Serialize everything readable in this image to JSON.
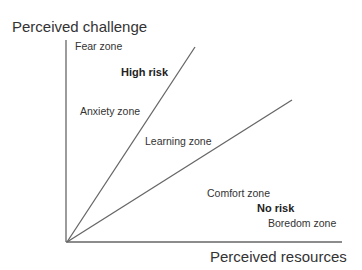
{
  "diagram": {
    "y_axis_label": "Perceived challenge",
    "x_axis_label": "Perceived resources",
    "zones": {
      "fear": "Fear zone",
      "anxiety": "Anxiety zone",
      "learning": "Learning zone",
      "comfort": "Comfort zone",
      "boredom": "Boredom zone"
    },
    "risk_labels": {
      "high": "High risk",
      "low": "No risk"
    },
    "line_color": "#666666"
  }
}
